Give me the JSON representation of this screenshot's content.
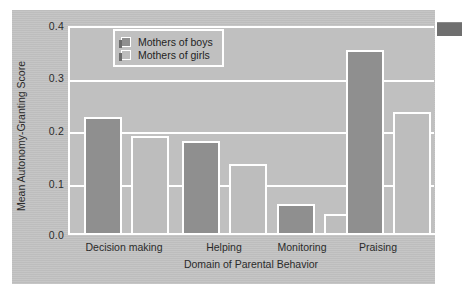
{
  "chart_data": {
    "type": "bar",
    "title": "",
    "xlabel": "Domain of Parental Behavior",
    "ylabel": "Mean Autonomy-Granting Score",
    "categories": [
      "Decision making",
      "Helping",
      "Monitoring",
      "Praising"
    ],
    "series": [
      {
        "name": "Mothers of boys",
        "values": [
          0.225,
          0.18,
          0.06,
          0.355
        ],
        "color": "#8f8f8f"
      },
      {
        "name": "Mothers of girls",
        "values": [
          0.19,
          0.135,
          0.04,
          0.235
        ],
        "color": "#bdbdbd"
      }
    ],
    "ylim": [
      0.0,
      0.4
    ],
    "yticks": [
      "0.0",
      "0.1",
      "0.2",
      "0.3",
      "0.4"
    ],
    "ytick_values": [
      0.0,
      0.1,
      0.2,
      0.3,
      0.4
    ],
    "grid": true,
    "grid_color": "#ffffff",
    "legend_position": "top-left-inside",
    "background_color": "#c0c0c0",
    "card_color": "#c3c3c3"
  },
  "legend": {
    "items": [
      {
        "label": "Mothers of boys"
      },
      {
        "label": "Mothers of girls"
      }
    ]
  },
  "accent": {
    "edge_tab_color": "#6f6f6f",
    "shadow_color": "#6b6b6b"
  }
}
